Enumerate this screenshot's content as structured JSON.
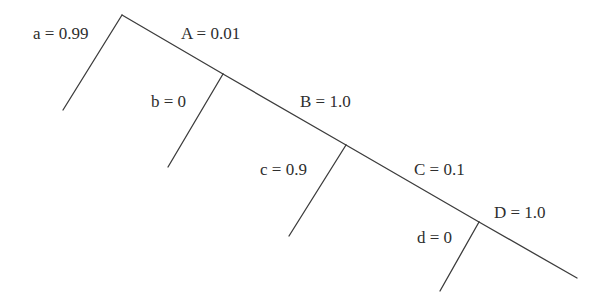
{
  "diagram": {
    "type": "caterpillar-tree",
    "labels": {
      "a": "a = 0.99",
      "A": "A = 0.01",
      "b": "b = 0",
      "B": "B = 1.0",
      "c": "c = 0.9",
      "C": "C = 0.1",
      "d": "d = 0",
      "D": "D = 1.0"
    },
    "branches": [
      {
        "id": "a",
        "value": 0.99
      },
      {
        "id": "A",
        "value": 0.01
      },
      {
        "id": "b",
        "value": 0
      },
      {
        "id": "B",
        "value": 1.0
      },
      {
        "id": "c",
        "value": 0.9
      },
      {
        "id": "C",
        "value": 0.1
      },
      {
        "id": "d",
        "value": 0
      },
      {
        "id": "D",
        "value": 1.0
      }
    ],
    "colors": {
      "line": "#3c3c3c",
      "text": "#2e2e2e",
      "background": "#ffffff"
    }
  }
}
